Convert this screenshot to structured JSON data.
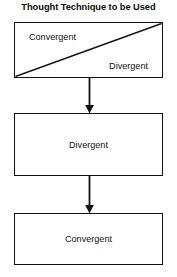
{
  "diagram": {
    "title": "Thought Technique to be Used",
    "type": "flowchart",
    "orientation": "vertical-top-down",
    "colors": {
      "stroke": "#111111",
      "background": "#ffffff",
      "text": "#111111"
    },
    "nodes": [
      {
        "id": "split-box",
        "shape": "rectangle",
        "divider": "diagonal-bottom-left-to-top-right",
        "labels": {
          "upper_left": "Convergent",
          "lower_right": "Divergent"
        }
      },
      {
        "id": "divergent-box",
        "shape": "rectangle",
        "label": "Divergent"
      },
      {
        "id": "convergent-box",
        "shape": "rectangle",
        "label": "Convergent"
      }
    ],
    "connectors": [
      {
        "id": "arrow-1",
        "from": "split-box",
        "to": "divergent-box",
        "arrowhead": "solid-triangle-down"
      },
      {
        "id": "arrow-2",
        "from": "divergent-box",
        "to": "convergent-box",
        "arrowhead": "solid-triangle-down"
      }
    ]
  }
}
